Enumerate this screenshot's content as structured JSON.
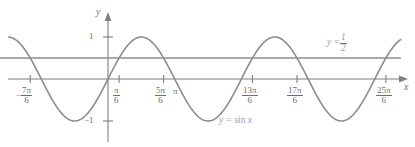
{
  "figure": {
    "kind": "coordinate-plane-graph",
    "axis_labels": {
      "x": "x",
      "y": "y"
    },
    "y_ticks": [
      {
        "value": 1,
        "label": "1"
      },
      {
        "value": -1,
        "label": "−1"
      }
    ],
    "x_ticks": [
      {
        "label": "-7pi/6",
        "sign": "−",
        "num": "7π",
        "den": "6",
        "value_pi_sixths": -7
      },
      {
        "label": "pi/6",
        "sign": "",
        "num": "π",
        "den": "6",
        "value_pi_sixths": 1
      },
      {
        "label": "5pi/6",
        "sign": "",
        "num": "5π",
        "den": "6",
        "value_pi_sixths": 5
      },
      {
        "label": "pi",
        "sign": "",
        "num": "π",
        "den": "",
        "value_pi_sixths": 6
      },
      {
        "label": "13pi/6",
        "sign": "",
        "num": "13π",
        "den": "6",
        "value_pi_sixths": 13
      },
      {
        "label": "17pi/6",
        "sign": "",
        "num": "17π",
        "den": "6",
        "value_pi_sixths": 17
      },
      {
        "label": "25pi/6",
        "sign": "",
        "num": "25π",
        "den": "6",
        "value_pi_sixths": 25
      }
    ],
    "curve_label": {
      "lhs": "y",
      "eq": "=",
      "rhs": "sin",
      "arg": "x"
    },
    "line_label": {
      "lhs": "y",
      "eq": "=",
      "num": "1",
      "den": "2"
    },
    "colors": {
      "axis": "#7f7f7f",
      "curve": "#8c8c8c",
      "horizontal_line": "#8c8c8c",
      "text": "#6e6e6e",
      "label_text": "#9a9a9a",
      "background": "#ffffff"
    }
  },
  "chart_data": {
    "type": "line",
    "title": "",
    "xlabel": "x",
    "ylabel": "y",
    "xlim": [
      -1.4875,
      4.3875
    ],
    "ylim": [
      -1.55,
      1.62
    ],
    "xlim_units": "pi radians",
    "grid": false,
    "legend": "inline-annotations",
    "series": [
      {
        "name": "y = sin x",
        "type": "sine",
        "amplitude": 1,
        "period_pi": 2,
        "phase": 0,
        "domain_pi": [
          -1.4875,
          4.3875
        ],
        "label": "y = sin x",
        "label_x_pi": 1.63,
        "label_y": -1.0,
        "color": "#8c8c8c"
      },
      {
        "name": "y = 1/2",
        "type": "horizontal-line",
        "y": 0.5,
        "domain_pi": [
          -1.62,
          4.39
        ],
        "label": "y = 1/2",
        "label_x_pi": 3.35,
        "label_y": 0.95,
        "color": "#8c8c8c"
      }
    ],
    "intersections_pi_sixths": [
      -7,
      1,
      5,
      13,
      17,
      25
    ],
    "xticks_pi_sixths": [
      -7,
      1,
      5,
      6,
      13,
      17,
      25
    ],
    "xticklabels": [
      "−7π/6",
      "π/6",
      "5π/6",
      "π",
      "13π/6",
      "17π/6",
      "25π/6"
    ],
    "yticks": [
      1,
      -1
    ],
    "yticklabels": [
      "1",
      "−1"
    ]
  }
}
